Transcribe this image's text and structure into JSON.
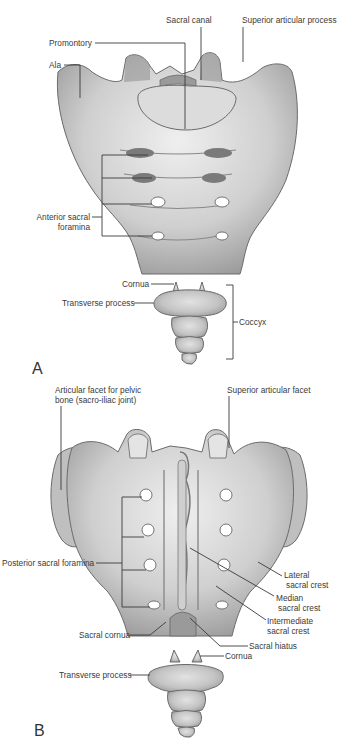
{
  "figure": {
    "panels": [
      {
        "id": "A",
        "letter": "A",
        "view": "anterior",
        "labels": {
          "sacral_canal": "Sacral canal",
          "superior_articular_process": "Superior articular process",
          "promontory": "Promontory",
          "ala": "Ala",
          "anterior_sacral_foramina_1": "Anterior sacral",
          "anterior_sacral_foramina_2": "foramina",
          "cornua": "Cornua",
          "transverse_process": "Transverse process",
          "coccyx": "Coccyx"
        }
      },
      {
        "id": "B",
        "letter": "B",
        "view": "posterior",
        "labels": {
          "articular_facet_1": "Articular facet for pelvic",
          "articular_facet_2": "bone (sacro-iliac joint)",
          "superior_articular_facet": "Superior articular facet",
          "posterior_sacral_foramina": "Posterior sacral foramina",
          "lateral_sacral_crest_1": "Lateral",
          "lateral_sacral_crest_2": "sacral crest",
          "median_sacral_crest_1": "Median",
          "median_sacral_crest_2": "sacral crest",
          "intermediate_sacral_crest_1": "Intermediate",
          "intermediate_sacral_crest_2": "sacral crest",
          "sacral_cornua": "Sacral cornua",
          "sacral_hiatus": "Sacral hiatus",
          "cornua": "Cornua",
          "transverse_process": "Transverse process"
        }
      }
    ],
    "colors": {
      "bone_light": "#e6e6e6",
      "bone_mid": "#bdbdbd",
      "bone_dark": "#8a8a8a",
      "leader_line": "#3a3a3a",
      "text": "#3a3a3a"
    }
  }
}
